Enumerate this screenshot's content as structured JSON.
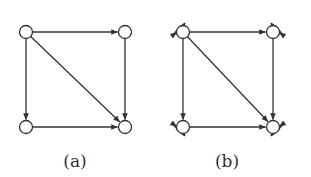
{
  "figure": {
    "panels": [
      {
        "id": "a",
        "caption": "(a)",
        "nodes": [
          {
            "id": "TL",
            "label": ""
          },
          {
            "id": "TR",
            "label": ""
          },
          {
            "id": "BL",
            "label": ""
          },
          {
            "id": "BR",
            "label": ""
          }
        ],
        "edges": [
          {
            "from": "TL",
            "to": "TR"
          },
          {
            "from": "TL",
            "to": "BL"
          },
          {
            "from": "TL",
            "to": "BR"
          },
          {
            "from": "TR",
            "to": "BR"
          },
          {
            "from": "BL",
            "to": "BR"
          }
        ],
        "self_loops": []
      },
      {
        "id": "b",
        "caption": "(b)",
        "nodes": [
          {
            "id": "TL",
            "label": ""
          },
          {
            "id": "TR",
            "label": ""
          },
          {
            "id": "BL",
            "label": ""
          },
          {
            "id": "BR",
            "label": ""
          }
        ],
        "edges": [
          {
            "from": "TL",
            "to": "TR"
          },
          {
            "from": "TL",
            "to": "BL"
          },
          {
            "from": "TL",
            "to": "BR"
          },
          {
            "from": "TR",
            "to": "BR"
          },
          {
            "from": "BL",
            "to": "BR"
          }
        ],
        "self_loops": [
          "TL",
          "TR",
          "BL",
          "BR"
        ]
      }
    ],
    "colors": {
      "stroke": "#333333",
      "node_fill": "#ffffff"
    }
  }
}
